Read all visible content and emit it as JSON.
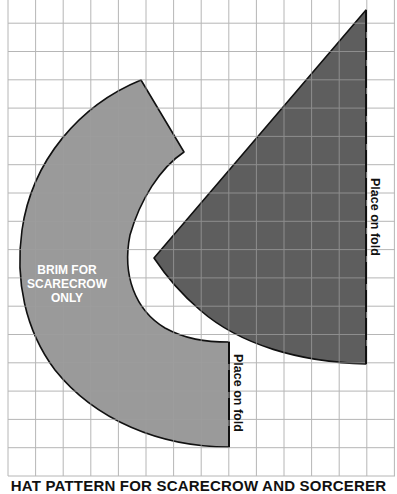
{
  "figure": {
    "caption": "HAT PATTERN FOR SCARECROW AND SORCERER",
    "background": "#ffffff",
    "grid": {
      "line_color": "#b0b0b0",
      "left": 8,
      "right": 395,
      "top": 0,
      "bottom": 476,
      "cell_width": 27.6,
      "cell_height": 28.3,
      "columns": 14,
      "rows": 17
    },
    "pieces": [
      {
        "id": "brim",
        "label_lines": [
          "BRIM FOR",
          "SCARECROW",
          "ONLY"
        ],
        "fill": "#9a9a9a",
        "fold_label": "Place on fold"
      },
      {
        "id": "cone",
        "fill": "#5e5e5e",
        "fold_label": "Place on fold"
      }
    ]
  }
}
